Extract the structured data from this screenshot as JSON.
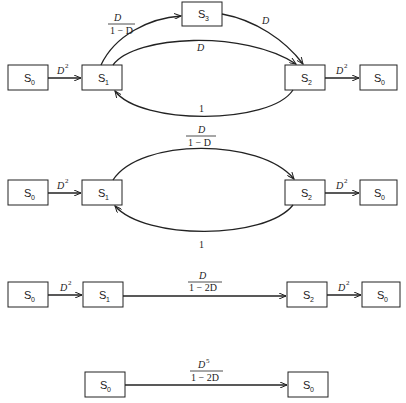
{
  "diagram": {
    "stages": [
      {
        "id": "stage-1",
        "nodes": [
          {
            "id": "s0-in",
            "label": "S",
            "sub": "0",
            "x": 8,
            "y": 65,
            "w": 40,
            "h": 25
          },
          {
            "id": "s1",
            "label": "S",
            "sub": "1",
            "x": 82,
            "y": 65,
            "w": 40,
            "h": 25
          },
          {
            "id": "s3",
            "label": "S",
            "sub": "3",
            "x": 182,
            "y": 2,
            "w": 40,
            "h": 24
          },
          {
            "id": "s2",
            "label": "S",
            "sub": "2",
            "x": 285,
            "y": 65,
            "w": 40,
            "h": 25
          },
          {
            "id": "s0-out",
            "label": "S",
            "sub": "0",
            "x": 360,
            "y": 65,
            "w": 37,
            "h": 25
          }
        ],
        "edges": [
          {
            "from": "s0-in",
            "to": "s1",
            "gain": "D",
            "gain_sup": "2"
          },
          {
            "from": "s1",
            "to": "s3",
            "gain_num": "D",
            "gain_den": "1 − D"
          },
          {
            "from": "s3",
            "to": "s2",
            "gain": "D"
          },
          {
            "from": "s1",
            "to": "s2",
            "gain": "D"
          },
          {
            "from": "s2",
            "to": "s1",
            "gain": "1"
          },
          {
            "from": "s2",
            "to": "s0-out",
            "gain": "D",
            "gain_sup": "2"
          }
        ]
      },
      {
        "id": "stage-2",
        "nodes": [
          {
            "id": "s0-in",
            "label": "S",
            "sub": "0",
            "x": 8,
            "y": 180,
            "w": 40,
            "h": 25
          },
          {
            "id": "s1",
            "label": "S",
            "sub": "1",
            "x": 82,
            "y": 180,
            "w": 40,
            "h": 25
          },
          {
            "id": "s2",
            "label": "S",
            "sub": "2",
            "x": 285,
            "y": 180,
            "w": 40,
            "h": 25
          },
          {
            "id": "s0-out",
            "label": "S",
            "sub": "0",
            "x": 360,
            "y": 180,
            "w": 37,
            "h": 25
          }
        ],
        "edges": [
          {
            "from": "s0-in",
            "to": "s1",
            "gain": "D",
            "gain_sup": "2"
          },
          {
            "from": "s1",
            "to": "s2",
            "gain_num": "D",
            "gain_den": "1 − D"
          },
          {
            "from": "s2",
            "to": "s1",
            "gain": "1"
          },
          {
            "from": "s2",
            "to": "s0-out",
            "gain": "D",
            "gain_sup": "2"
          }
        ]
      },
      {
        "id": "stage-3",
        "nodes": [
          {
            "id": "s0-in",
            "label": "S",
            "sub": "0",
            "x": 8,
            "y": 282,
            "w": 40,
            "h": 25
          },
          {
            "id": "s1",
            "label": "S",
            "sub": "1",
            "x": 83,
            "y": 282,
            "w": 40,
            "h": 25
          },
          {
            "id": "s2",
            "label": "S",
            "sub": "2",
            "x": 287,
            "y": 282,
            "w": 40,
            "h": 25
          },
          {
            "id": "s0-out",
            "label": "S",
            "sub": "0",
            "x": 362,
            "y": 282,
            "w": 38,
            "h": 25
          }
        ],
        "edges": [
          {
            "from": "s0-in",
            "to": "s1",
            "gain": "D",
            "gain_sup": "2"
          },
          {
            "from": "s1",
            "to": "s2",
            "gain_num": "D",
            "gain_den": "1 − 2D"
          },
          {
            "from": "s2",
            "to": "s0-out",
            "gain": "D",
            "gain_sup": "2"
          }
        ]
      },
      {
        "id": "stage-4",
        "nodes": [
          {
            "id": "s0-in",
            "label": "S",
            "sub": "0",
            "x": 85,
            "y": 372,
            "w": 40,
            "h": 25
          },
          {
            "id": "s0-out",
            "label": "S",
            "sub": "0",
            "x": 288,
            "y": 372,
            "w": 40,
            "h": 25
          }
        ],
        "edges": [
          {
            "from": "s0-in",
            "to": "s0-out",
            "gain_num": "D",
            "gain_num_sup": "5",
            "gain_den": "1 − 2D"
          }
        ]
      }
    ]
  },
  "text": {
    "S": "S",
    "sub0": "0",
    "sub1": "1",
    "sub2": "2",
    "sub3": "3",
    "D": "D",
    "sq": "2",
    "five": "5",
    "one": "1",
    "one_minus_D": "1 − D",
    "one_minus_2D": "1 − 2D"
  }
}
